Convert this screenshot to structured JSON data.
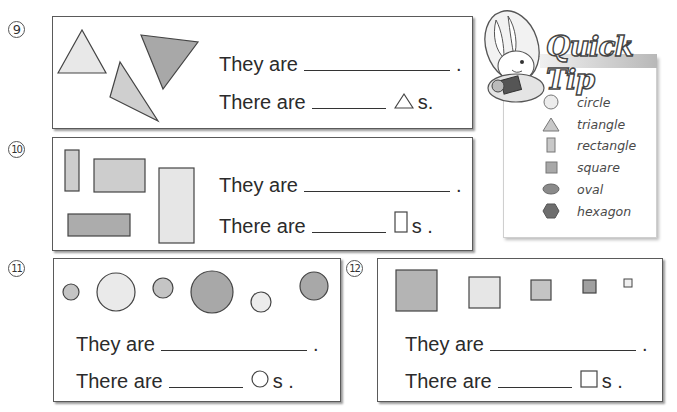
{
  "questions": [
    {
      "number": "9",
      "number_glyph": "⑨",
      "shape_type": "triangle",
      "line1": {
        "prefix": "They are",
        "suffix": "."
      },
      "line2": {
        "prefix": "There are",
        "icon": "triangle-icon",
        "suffix": "s."
      },
      "shapes": [
        {
          "kind": "triangle",
          "fill": "#e8e8e8"
        },
        {
          "kind": "triangle",
          "fill": "#a8a8a8"
        },
        {
          "kind": "triangle",
          "fill": "#cfcfcf"
        }
      ]
    },
    {
      "number": "10",
      "number_glyph": "⑩",
      "shape_type": "rectangle",
      "line1": {
        "prefix": "They are",
        "suffix": "."
      },
      "line2": {
        "prefix": "There are",
        "icon": "rectangle-icon",
        "suffix": "s ."
      },
      "shapes": [
        {
          "kind": "rectangle",
          "fill": "#cdcdcd"
        },
        {
          "kind": "rectangle",
          "fill": "#cdcdcd"
        },
        {
          "kind": "rectangle",
          "fill": "#e6e6e6"
        },
        {
          "kind": "rectangle",
          "fill": "#acacac"
        }
      ]
    },
    {
      "number": "11",
      "number_glyph": "⑪",
      "shape_type": "circle",
      "line1": {
        "prefix": "They are",
        "suffix": "."
      },
      "line2": {
        "prefix": "There are",
        "icon": "circle-icon",
        "suffix": "s ."
      },
      "shapes": [
        {
          "kind": "circle",
          "fill": "#c4c4c4"
        },
        {
          "kind": "circle",
          "fill": "#eaeaea"
        },
        {
          "kind": "circle",
          "fill": "#c4c4c4"
        },
        {
          "kind": "circle",
          "fill": "#a8a8a8"
        },
        {
          "kind": "circle",
          "fill": "#ececec"
        },
        {
          "kind": "circle",
          "fill": "#a8a8a8"
        }
      ]
    },
    {
      "number": "12",
      "number_glyph": "⑫",
      "shape_type": "square",
      "line1": {
        "prefix": "They are",
        "suffix": "."
      },
      "line2": {
        "prefix": "There are",
        "icon": "square-icon",
        "suffix": "s ."
      },
      "shapes": [
        {
          "kind": "square",
          "fill": "#b4b4b4"
        },
        {
          "kind": "square",
          "fill": "#e6e6e6"
        },
        {
          "kind": "square",
          "fill": "#c4c4c4"
        },
        {
          "kind": "square",
          "fill": "#a0a0a0"
        },
        {
          "kind": "square",
          "fill": "#f0f0f0"
        }
      ]
    }
  ],
  "quick_tip": {
    "title": "Quick Tip",
    "mascot": "bunny-mascot",
    "items": [
      {
        "icon": "circle-icon",
        "label": "circle"
      },
      {
        "icon": "triangle-icon",
        "label": "triangle"
      },
      {
        "icon": "rectangle-icon",
        "label": "rectangle"
      },
      {
        "icon": "square-icon",
        "label": "square"
      },
      {
        "icon": "oval-icon",
        "label": "oval"
      },
      {
        "icon": "hexagon-icon",
        "label": "hexagon"
      }
    ]
  },
  "colors": {
    "border": "#5a5a5a",
    "shadow": "#9a9a9a",
    "text": "#2b2b2b"
  }
}
